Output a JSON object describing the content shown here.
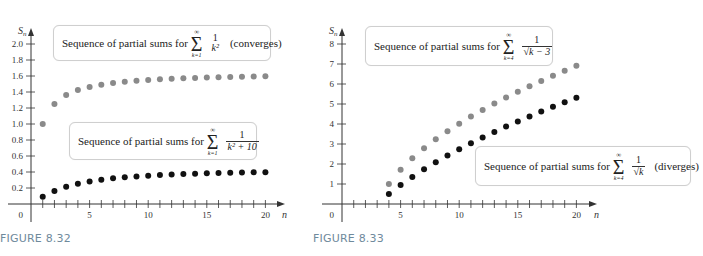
{
  "figures": [
    {
      "caption": "FIGURE 8.32",
      "y_axis_label": "S",
      "y_axis_sub": "n",
      "x_axis_label": "n",
      "origin_label": "0",
      "callouts": [
        {
          "prefix": "Sequence of partial sums for",
          "sigma_top": "∞",
          "sigma_bottom": "k=1",
          "numerator": "1",
          "denominator": "k²",
          "note": "(converges)"
        },
        {
          "prefix": "Sequence of partial sums for",
          "sigma_top": "∞",
          "sigma_bottom": "k=1",
          "numerator": "1",
          "denominator": "k² + 10",
          "note": ""
        }
      ]
    },
    {
      "caption": "FIGURE 8.33",
      "y_axis_label": "S",
      "y_axis_sub": "n",
      "x_axis_label": "n",
      "origin_label": "0",
      "callouts": [
        {
          "prefix": "Sequence of partial sums for",
          "sigma_top": "∞",
          "sigma_bottom": "k=4",
          "numerator": "1",
          "denominator": "√k − 3",
          "note": ""
        },
        {
          "prefix": "Sequence of partial sums for",
          "sigma_top": "∞",
          "sigma_bottom": "k=4",
          "numerator": "1",
          "denominator": "√k",
          "note": "(diverges)"
        }
      ]
    }
  ],
  "colors": {
    "gray_series": "#8a8a8a",
    "black_series": "#111111",
    "axis": "#333333",
    "caption": "#6f8a9c"
  },
  "chart_data": [
    {
      "type": "scatter",
      "title": "FIGURE 8.32",
      "xlabel": "n",
      "ylabel": "S_n",
      "xlim": [
        0,
        21
      ],
      "ylim": [
        0,
        2.1
      ],
      "x_ticks": [
        5,
        10,
        15,
        20
      ],
      "y_ticks": [
        0.2,
        0.4,
        0.6,
        0.8,
        1.0,
        1.2,
        1.4,
        1.6,
        1.8,
        2.0
      ],
      "y_tick_labels": [
        "0.2",
        "0.4",
        "0.6",
        "0.8",
        "1.0",
        "1.2",
        "1.4",
        "1.6",
        "1.8",
        "2.0"
      ],
      "grid": false,
      "x": [
        1,
        2,
        3,
        4,
        5,
        6,
        7,
        8,
        9,
        10,
        11,
        12,
        13,
        14,
        15,
        16,
        17,
        18,
        19,
        20
      ],
      "series": [
        {
          "name": "Sequence of partial sums for Σ_{k=1}^∞ 1/k² (converges)",
          "color": "#8a8a8a",
          "values": [
            1.0,
            1.25,
            1.361,
            1.424,
            1.464,
            1.491,
            1.512,
            1.527,
            1.54,
            1.55,
            1.558,
            1.565,
            1.571,
            1.576,
            1.58,
            1.584,
            1.588,
            1.591,
            1.594,
            1.596
          ]
        },
        {
          "name": "Sequence of partial sums for Σ_{k=1}^∞ 1/(k² + 10)",
          "color": "#111111",
          "values": [
            0.091,
            0.162,
            0.215,
            0.253,
            0.282,
            0.304,
            0.321,
            0.334,
            0.345,
            0.354,
            0.362,
            0.368,
            0.374,
            0.379,
            0.383,
            0.387,
            0.39,
            0.393,
            0.396,
            0.398
          ]
        }
      ]
    },
    {
      "type": "scatter",
      "title": "FIGURE 8.33",
      "xlabel": "n",
      "ylabel": "S_n",
      "xlim": [
        0,
        21
      ],
      "ylim": [
        0,
        8.5
      ],
      "x_ticks": [
        5,
        10,
        15,
        20
      ],
      "y_ticks": [
        1,
        2,
        3,
        4,
        5,
        6,
        7,
        8
      ],
      "y_tick_labels": [
        "1",
        "2",
        "3",
        "4",
        "5",
        "6",
        "7",
        "8"
      ],
      "grid": false,
      "x": [
        4,
        5,
        6,
        7,
        8,
        9,
        10,
        11,
        12,
        13,
        14,
        15,
        16,
        17,
        18,
        19,
        20
      ],
      "series": [
        {
          "name": "Sequence of partial sums for Σ_{k=4}^∞ 1/√(k − 3)",
          "color": "#8a8a8a",
          "values": [
            1.0,
            1.707,
            2.285,
            2.785,
            3.232,
            3.64,
            4.018,
            4.372,
            4.705,
            5.021,
            5.323,
            5.611,
            5.889,
            6.156,
            6.414,
            6.664,
            6.907
          ]
        },
        {
          "name": "Sequence of partial sums for Σ_{k=4}^∞ 1/√k (diverges)",
          "color": "#111111",
          "values": [
            0.5,
            0.947,
            1.356,
            1.734,
            2.087,
            2.42,
            2.737,
            3.038,
            3.327,
            3.604,
            3.872,
            4.13,
            4.38,
            4.622,
            4.858,
            5.087,
            5.311
          ]
        }
      ]
    }
  ]
}
